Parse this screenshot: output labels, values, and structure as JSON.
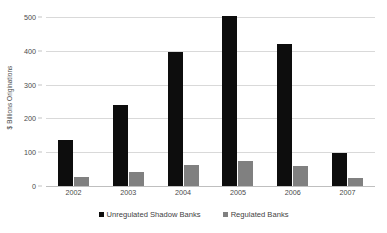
{
  "chart_data": {
    "type": "bar",
    "title": "",
    "subtitle": "",
    "xlabel": "",
    "ylabel": "$ Billions Originations",
    "categories": [
      "2002",
      "2003",
      "2004",
      "2005",
      "2006",
      "2007"
    ],
    "series": [
      {
        "name": "Unregulated Shadow Banks",
        "color": "#0d0d0d",
        "values": [
          135,
          240,
          396,
          503,
          420,
          97
        ]
      },
      {
        "name": "Regulated Banks",
        "color": "#808080",
        "values": [
          27,
          41,
          62,
          75,
          60,
          25
        ]
      }
    ],
    "ylim": [
      0,
      500
    ],
    "yticks": [
      0,
      100,
      200,
      300,
      400,
      500
    ],
    "ytick_labels": [
      "0",
      "100",
      "200",
      "300",
      "400",
      "500"
    ],
    "grid": true,
    "grid_axis": "y",
    "grid_color": "#d9d9d9",
    "legend": true,
    "legend_position": "bottom",
    "background_color": "#ffffff",
    "plot_border": false
  }
}
